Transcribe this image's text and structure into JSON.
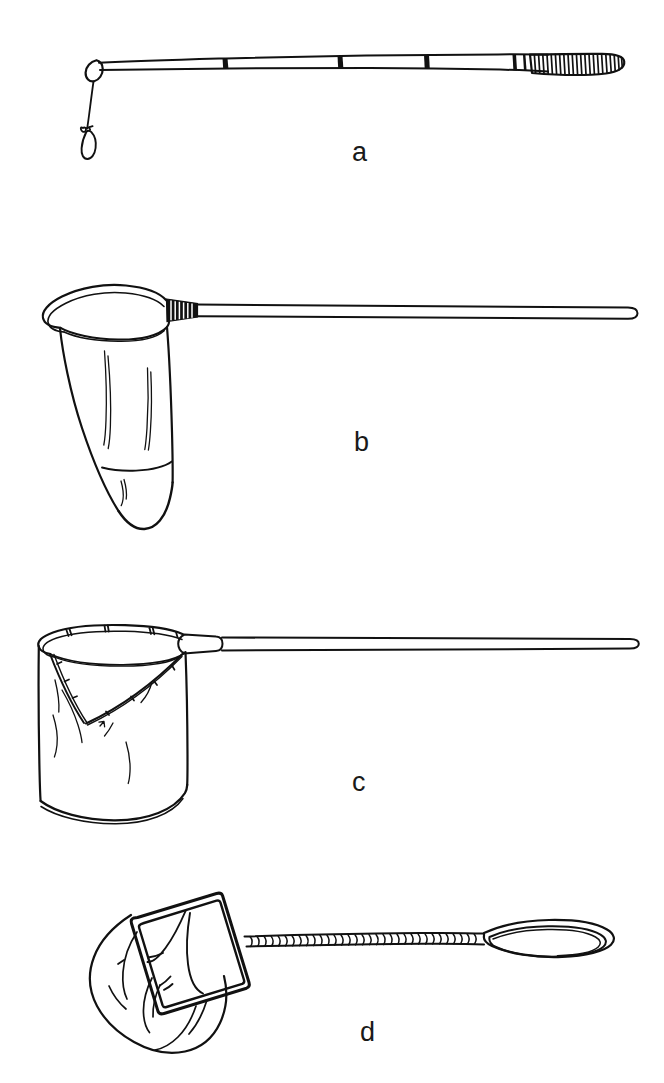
{
  "figure": {
    "type": "line-drawing-plate",
    "background_color": "#ffffff",
    "ink_color": "#111111",
    "width": 664,
    "height": 1083,
    "panel_count": 4
  },
  "labels": {
    "a": "a",
    "b": "b",
    "c": "c",
    "d": "d"
  },
  "panels": [
    {
      "key": "a",
      "label": "a",
      "caption_position": {
        "x": 352,
        "y": 139
      },
      "object_name": "fishing-rod",
      "description": "jointed fishing rod with wrapped grip, hanging line and hook",
      "parts": [
        "rod-tip-loop",
        "rod-segments",
        "ferrule-bands",
        "wrapped-grip",
        "fishing-line",
        "hook"
      ],
      "segment_count": 4,
      "ferrule_band_count": 3
    },
    {
      "key": "b",
      "label": "b",
      "caption_position": {
        "x": 354,
        "y": 429
      },
      "object_name": "conical-dip-net",
      "description": "rounded triangular hoop net with deep conical bag on a long straight pole",
      "parts": [
        "hoop-rim",
        "net-bag",
        "binding-wrap",
        "pole"
      ],
      "pole_end": "rounded"
    },
    {
      "key": "c",
      "label": "c",
      "caption_position": {
        "x": 352,
        "y": 769
      },
      "object_name": "flat-bottom-scoop-net",
      "description": "hoop net with V-seamed flat-bottomed bag, tapered collar ferrule and long pole",
      "parts": [
        "hoop-rim",
        "lashing-ticks",
        "v-seam",
        "net-bag",
        "collar-ferrule",
        "pole"
      ],
      "lashing_tick_count": 8
    },
    {
      "key": "d",
      "label": "d",
      "caption_position": {
        "x": 360,
        "y": 1019
      },
      "object_name": "rectangular-frame-net",
      "description": "tilted rectangular framed net with twisted rope handle ending in a loop",
      "parts": [
        "rectangular-frame",
        "net-bag",
        "twisted-rope-handle",
        "hand-loop"
      ]
    }
  ]
}
